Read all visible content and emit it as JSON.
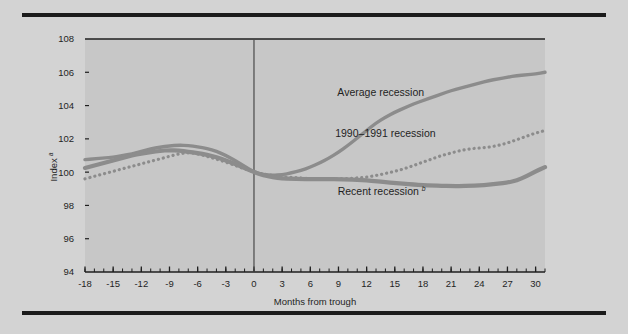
{
  "figure": {
    "background_color": "#d3d3d3",
    "plot_background_color": "#c7c7c7",
    "rule_color": "#1b1b1b",
    "axis_color": "#3a3a3a"
  },
  "chart_data": {
    "type": "line",
    "title": "",
    "subtitle": "",
    "xlabel": "Months from trough",
    "ylabel": "Index",
    "ylabel_superscript": "a",
    "xlim": [
      -18,
      31
    ],
    "ylim": [
      94,
      108
    ],
    "grid": false,
    "legend_position": "inline-annotations",
    "x_ticks": [
      -18,
      -15,
      -12,
      -9,
      -6,
      -3,
      0,
      3,
      6,
      9,
      12,
      15,
      18,
      21,
      24,
      27,
      30
    ],
    "x_tick_labels": [
      "-18",
      "-15",
      "-12",
      "-9",
      "-6",
      "-3",
      "0",
      "3",
      "6",
      "9",
      "12",
      "15",
      "18",
      "21",
      "24",
      "27",
      "30"
    ],
    "x_minor_tick_step": 1,
    "y_ticks": [
      94,
      96,
      98,
      100,
      102,
      104,
      106,
      108
    ],
    "y_tick_labels": [
      "94",
      "96",
      "98",
      "100",
      "102",
      "104",
      "106",
      "108"
    ],
    "reference_line_x": 0,
    "annotations": [
      {
        "name": "average-recession-label",
        "text": "Average recession",
        "x": 13.5,
        "y": 104.6
      },
      {
        "name": "recession-1990-1991-label",
        "text": "1990–1991 recession",
        "x": 14.0,
        "y": 102.1
      },
      {
        "name": "recent-recession-label",
        "text": "Recent recession",
        "superscript": "b",
        "x": 13.6,
        "y": 98.6
      }
    ],
    "x": [
      -18,
      -17,
      -16,
      -15,
      -14,
      -13,
      -12,
      -11,
      -10,
      -9,
      -8,
      -7,
      -6,
      -5,
      -4,
      -3,
      -2,
      -1,
      0,
      1,
      2,
      3,
      4,
      5,
      6,
      7,
      8,
      9,
      10,
      11,
      12,
      13,
      14,
      15,
      16,
      17,
      18,
      19,
      20,
      21,
      22,
      23,
      24,
      25,
      26,
      27,
      28,
      29,
      30,
      31
    ],
    "series": [
      {
        "name": "Average recession",
        "style": "solid",
        "color": "#8c8c8c",
        "width": 3.4,
        "values": [
          100.75,
          100.8,
          100.85,
          100.9,
          101.0,
          101.1,
          101.25,
          101.4,
          101.5,
          101.58,
          101.62,
          101.6,
          101.52,
          101.42,
          101.25,
          101.0,
          100.7,
          100.35,
          100.0,
          99.85,
          99.8,
          99.85,
          99.95,
          100.1,
          100.3,
          100.55,
          100.85,
          101.2,
          101.6,
          102.05,
          102.5,
          102.95,
          103.3,
          103.6,
          103.85,
          104.1,
          104.3,
          104.5,
          104.7,
          104.9,
          105.05,
          105.2,
          105.35,
          105.5,
          105.6,
          105.7,
          105.8,
          105.85,
          105.9,
          106.0
        ]
      },
      {
        "name": "1990–1991 recession",
        "style": "dotted",
        "color": "#8c8c8c",
        "width": 3.2,
        "values": [
          99.6,
          99.75,
          99.9,
          100.05,
          100.2,
          100.35,
          100.5,
          100.65,
          100.8,
          100.95,
          101.1,
          101.18,
          101.1,
          100.95,
          100.78,
          100.6,
          100.4,
          100.2,
          100.0,
          99.88,
          99.8,
          99.72,
          99.68,
          99.65,
          99.62,
          99.6,
          99.6,
          99.6,
          99.62,
          99.65,
          99.7,
          99.8,
          99.92,
          100.05,
          100.2,
          100.4,
          100.6,
          100.8,
          101.0,
          101.15,
          101.3,
          101.4,
          101.45,
          101.5,
          101.6,
          101.75,
          101.95,
          102.15,
          102.35,
          102.5
        ]
      },
      {
        "name": "Recent recession",
        "style": "solid",
        "color": "#8c8c8c",
        "width": 4.2,
        "values": [
          100.25,
          100.4,
          100.55,
          100.7,
          100.85,
          101.0,
          101.12,
          101.2,
          101.28,
          101.32,
          101.3,
          101.22,
          101.15,
          101.05,
          100.9,
          100.7,
          100.48,
          100.25,
          100.0,
          99.82,
          99.7,
          99.62,
          99.6,
          99.58,
          99.58,
          99.58,
          99.58,
          99.58,
          99.56,
          99.54,
          99.5,
          99.45,
          99.4,
          99.35,
          99.3,
          99.25,
          99.22,
          99.2,
          99.18,
          99.17,
          99.16,
          99.18,
          99.2,
          99.25,
          99.3,
          99.38,
          99.5,
          99.75,
          100.05,
          100.3
        ]
      }
    ]
  }
}
